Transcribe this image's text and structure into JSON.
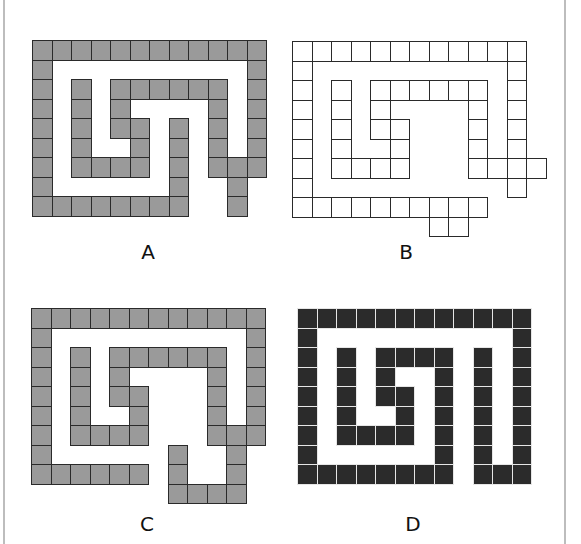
{
  "figure": {
    "cell_size": 19.5,
    "colors": {
      "gray_fill": "#9a9a9a",
      "outline": "#2a2a2a",
      "dark_fill": "#2b2b2b",
      "background": "#ffffff"
    },
    "panels": [
      {
        "label": "A",
        "style": "gray",
        "origin": [
          32,
          40
        ],
        "label_pos": [
          128,
          240
        ],
        "rows": [
          [
            0,
            1,
            2,
            3,
            4,
            5,
            6,
            7,
            8,
            9,
            10,
            11
          ],
          [
            0,
            11
          ],
          [
            0,
            2,
            4,
            5,
            6,
            7,
            8,
            9,
            11
          ],
          [
            0,
            2,
            4,
            9,
            11
          ],
          [
            0,
            2,
            4,
            5,
            7,
            9,
            11
          ],
          [
            0,
            2,
            5,
            7,
            9,
            11
          ],
          [
            0,
            2,
            3,
            4,
            5,
            7,
            9,
            10,
            11
          ],
          [
            0,
            7,
            10
          ],
          [
            0,
            1,
            2,
            3,
            4,
            5,
            6,
            7,
            10
          ]
        ]
      },
      {
        "label": "B",
        "style": "white",
        "origin": [
          292,
          41
        ],
        "label_pos": [
          386,
          240
        ],
        "rows": [
          [
            0,
            1,
            2,
            3,
            4,
            5,
            6,
            7,
            8,
            9,
            10,
            11
          ],
          [
            0,
            11
          ],
          [
            0,
            2,
            4,
            5,
            6,
            7,
            8,
            9,
            11
          ],
          [
            0,
            2,
            4,
            9,
            11
          ],
          [
            0,
            2,
            4,
            5,
            9,
            11
          ],
          [
            0,
            2,
            5,
            9,
            11
          ],
          [
            0,
            2,
            3,
            4,
            5,
            9,
            10,
            11,
            12
          ],
          [
            0,
            11
          ],
          [
            0,
            1,
            2,
            3,
            4,
            5,
            6,
            7,
            8,
            9
          ],
          [
            7,
            8
          ]
        ]
      },
      {
        "label": "C",
        "style": "gray",
        "origin": [
          31,
          308
        ],
        "label_pos": [
          127,
          512
        ],
        "rows": [
          [
            0,
            1,
            2,
            3,
            4,
            5,
            6,
            7,
            8,
            9,
            10,
            11
          ],
          [
            0,
            11
          ],
          [
            0,
            2,
            4,
            5,
            6,
            7,
            8,
            9,
            11
          ],
          [
            0,
            2,
            4,
            9,
            11
          ],
          [
            0,
            2,
            4,
            5,
            9,
            11
          ],
          [
            0,
            2,
            5,
            9,
            11
          ],
          [
            0,
            2,
            3,
            4,
            5,
            9,
            10,
            11
          ],
          [
            0,
            7,
            10
          ],
          [
            0,
            1,
            2,
            3,
            4,
            5,
            7,
            10
          ],
          [
            7,
            8,
            9,
            10
          ]
        ]
      },
      {
        "label": "D",
        "style": "dark",
        "origin": [
          297,
          308
        ],
        "label_pos": [
          393,
          512
        ],
        "rows": [
          [
            0,
            1,
            2,
            3,
            4,
            5,
            6,
            7,
            8,
            9,
            10,
            11
          ],
          [
            0,
            11
          ],
          [
            0,
            2,
            4,
            5,
            6,
            7,
            9,
            11
          ],
          [
            0,
            2,
            4,
            7,
            9,
            11
          ],
          [
            0,
            2,
            4,
            5,
            7,
            9,
            11
          ],
          [
            0,
            2,
            5,
            7,
            9,
            11
          ],
          [
            0,
            2,
            3,
            4,
            5,
            7,
            9,
            11
          ],
          [
            0,
            7,
            9,
            11
          ],
          [
            0,
            1,
            2,
            3,
            4,
            5,
            6,
            7,
            9,
            10,
            11
          ]
        ]
      }
    ]
  }
}
